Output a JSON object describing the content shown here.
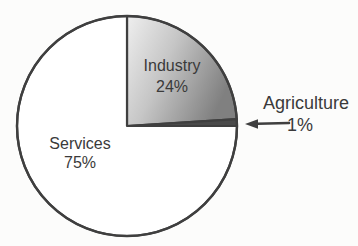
{
  "chart_data": {
    "type": "pie",
    "title": "",
    "slices": [
      {
        "label": "Industry",
        "value": 24,
        "display": "24%",
        "fill": "gradient"
      },
      {
        "label": "Agriculture",
        "value": 1,
        "display": "1%",
        "fill": "#4a4a4a"
      },
      {
        "label": "Services",
        "value": 75,
        "display": "75%",
        "fill": "#ffffff"
      }
    ],
    "start_angle_deg": 0,
    "direction": "clockwise",
    "legend": "none",
    "outline_color": "#3f3f3f",
    "text_color": "#3a3a3a",
    "gradient_stops": [
      "#efefef",
      "#c6c6c6",
      "#808080"
    ],
    "center": [
      127,
      126
    ],
    "radius": 110,
    "annotation_arrow": {
      "target": "Agriculture",
      "direction": "points-left-at-thin-slice"
    }
  }
}
